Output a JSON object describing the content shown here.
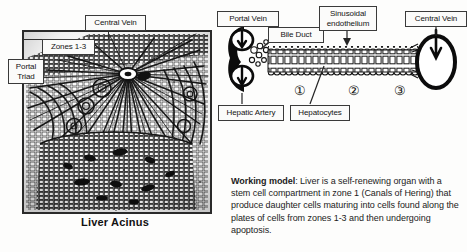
{
  "figure": {
    "caption": "Liver Acinus"
  },
  "left_panel": {
    "name": "liver-acinus-illustration",
    "labels": [
      {
        "id": "central-vein",
        "text": "Central Vein"
      },
      {
        "id": "zones",
        "text": "Zones 1-3"
      },
      {
        "id": "portal-triad",
        "line1": "Portal",
        "line2": "Triad"
      }
    ]
  },
  "right_diagram": {
    "name": "sinusoid-schematic",
    "labels": [
      {
        "id": "portal-vein",
        "text": "Portal Vein"
      },
      {
        "id": "bile-duct",
        "text": "Bile Duct"
      },
      {
        "id": "sinusoidal-endothelium-l1",
        "text": "Sinusoidal"
      },
      {
        "id": "sinusoidal-endothelium-l2",
        "text": "endothelium"
      },
      {
        "id": "central-vein",
        "text": "Central Vein"
      },
      {
        "id": "hepatic-artery",
        "text": "Hepatic Artery"
      },
      {
        "id": "hepatocytes",
        "text": "Hepatocytes"
      }
    ],
    "zone_markers": [
      {
        "id": "zone-1",
        "glyph": "①"
      },
      {
        "id": "zone-2",
        "glyph": "②"
      },
      {
        "id": "zone-3",
        "glyph": "③"
      }
    ]
  },
  "working_model": {
    "heading": "Working model",
    "separator": ":",
    "body": " Liver is a self-renewing organ with a stem cell compartment in zone 1 (Canals of Hering) that produce daughter cells maturing into cells found along the plates of cells from zones 1-3 and then undergoing apoptosis."
  },
  "colors": {
    "page_background": "#fdfdfc",
    "ink": "#1a1a1a",
    "label_border": "#3a3a3a",
    "label_fill": "#fbfbfa",
    "frame": "#2a2a2a"
  }
}
